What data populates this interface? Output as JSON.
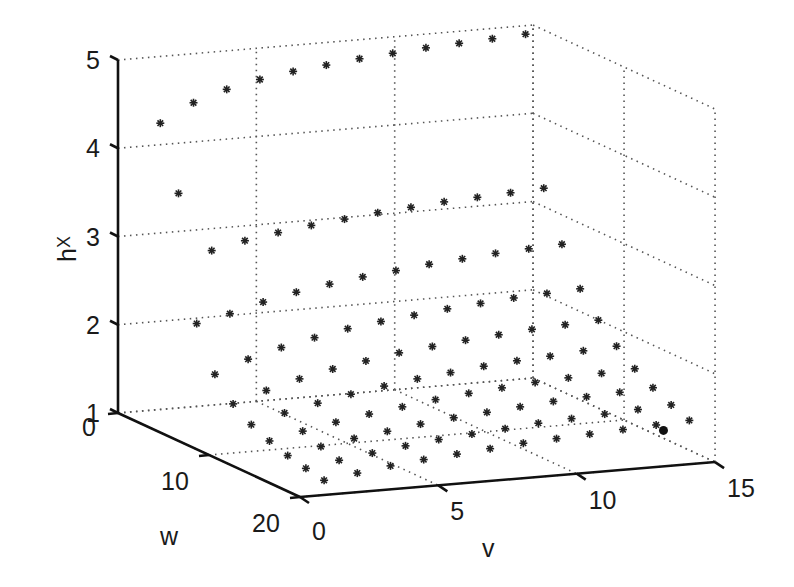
{
  "chart_data": {
    "type": "scatter3d",
    "title": "",
    "xlabel": "v",
    "ylabel": "w",
    "zlabel": "h_X",
    "xlim": [
      0,
      15
    ],
    "ylim": [
      0,
      20
    ],
    "zlim": [
      1,
      5
    ],
    "x_ticks": [
      0,
      5,
      10,
      15
    ],
    "y_ticks": [
      0,
      10,
      20
    ],
    "z_ticks": [
      1,
      2,
      3,
      4,
      5
    ],
    "grid": true,
    "marker": "asterisk",
    "v_values": [
      1.2,
      2.4,
      3.6,
      4.8,
      6.0,
      7.2,
      8.4,
      9.6,
      10.8,
      12.0,
      13.2,
      14.4
    ],
    "w_values": [
      1,
      3,
      5,
      7,
      9,
      11,
      13,
      15,
      17,
      19
    ],
    "h_grid": [
      [
        4.3,
        4.5,
        4.62,
        4.7,
        4.76,
        4.8,
        4.84,
        4.87,
        4.9,
        4.92,
        4.94,
        4.96
      ],
      [
        3.6,
        2.92,
        3.0,
        3.06,
        3.11,
        3.15,
        3.19,
        3.22,
        3.25,
        3.27,
        3.29,
        3.31
      ],
      [
        2.22,
        2.3,
        2.4,
        2.48,
        2.54,
        2.59,
        2.63,
        2.67,
        2.7,
        2.73,
        2.75,
        2.77
      ],
      [
        1.74,
        1.88,
        1.98,
        2.06,
        2.13,
        2.18,
        2.22,
        2.26,
        2.29,
        2.32,
        2.34,
        2.36
      ],
      [
        1.5,
        1.62,
        1.72,
        1.8,
        1.86,
        1.92,
        1.96,
        2.0,
        2.03,
        2.06,
        2.08,
        2.1
      ],
      [
        1.36,
        1.46,
        1.54,
        1.61,
        1.67,
        1.72,
        1.76,
        1.8,
        1.83,
        1.85,
        1.88,
        1.9
      ],
      [
        1.27,
        1.35,
        1.42,
        1.48,
        1.53,
        1.58,
        1.62,
        1.65,
        1.68,
        1.7,
        1.72,
        1.74
      ],
      [
        1.2,
        1.27,
        1.33,
        1.38,
        1.43,
        1.47,
        1.5,
        1.53,
        1.56,
        1.58,
        1.6,
        1.62
      ],
      [
        1.15,
        1.21,
        1.26,
        1.31,
        1.35,
        1.38,
        1.41,
        1.44,
        1.46,
        1.48,
        1.5,
        1.52
      ],
      [
        1.11,
        1.16,
        1.21,
        1.25,
        1.28,
        1.31,
        1.34,
        1.36,
        1.38,
        1.4,
        1.42,
        1.44
      ]
    ],
    "highlight_point": {
      "v": 13.3,
      "w": 19.5,
      "h": 1.38,
      "marker": "filled-circle"
    }
  },
  "projection": {
    "origin": [
      118,
      413
    ],
    "v_step": [
      27.67,
      -2.33
    ],
    "w_step": [
      9.1,
      4.2
    ],
    "h_step": [
      0,
      -88.25
    ]
  },
  "labels": {
    "x_axis": "v",
    "y_axis": "w",
    "z_axis_main": "h",
    "z_axis_sub": "X"
  }
}
